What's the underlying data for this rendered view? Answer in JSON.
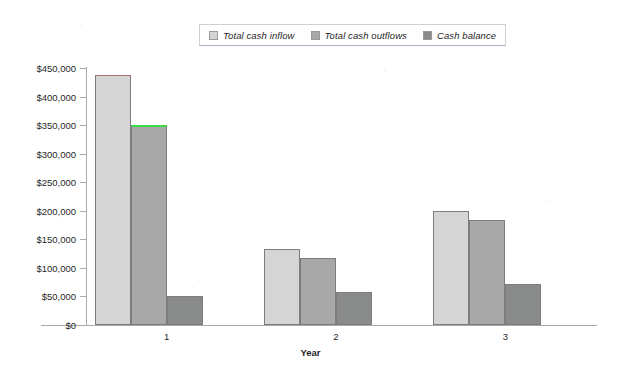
{
  "chart_data": {
    "type": "bar",
    "title": "",
    "xlabel": "Year",
    "ylabel": "",
    "categories": [
      "1",
      "2",
      "3"
    ],
    "series": [
      {
        "name": "Total cash inflow",
        "color": "#d4d5d4",
        "values": [
          438000,
          133000,
          199000
        ]
      },
      {
        "name": "Total cash outflows",
        "color": "#a7a8a7",
        "values": [
          350000,
          117000,
          184000
        ]
      },
      {
        "name": "Cash balance",
        "color": "#898b8b",
        "values": [
          51000,
          58000,
          72000
        ]
      }
    ],
    "ylim": [
      0,
      450000
    ],
    "ytick_step": 50000,
    "ytick_labels": [
      "$450,000",
      "$400,000",
      "$350,000",
      "$300,000",
      "$250,000",
      "$200,000",
      "$150,000",
      "$100,000",
      "$50,000",
      "$0"
    ],
    "ytick_values": [
      450000,
      400000,
      350000,
      300000,
      250000,
      200000,
      150000,
      100000,
      50000,
      0
    ],
    "grid": false,
    "legend_position": "top-center",
    "annotations": [
      {
        "series": "Total cash outflows",
        "category": "1",
        "type": "highlight-line",
        "color": "#3ddb4a"
      },
      {
        "series": "Total cash inflow",
        "category": "1",
        "type": "highlight-line",
        "color": "#b07070"
      }
    ]
  },
  "legend": {
    "items": [
      {
        "label": "Total cash inflow",
        "color": "#d4d5d4"
      },
      {
        "label": "Total cash outflows",
        "color": "#a7a8a7"
      },
      {
        "label": "Cash balance",
        "color": "#898b8b"
      }
    ]
  },
  "axes": {
    "x_title": "Year"
  }
}
